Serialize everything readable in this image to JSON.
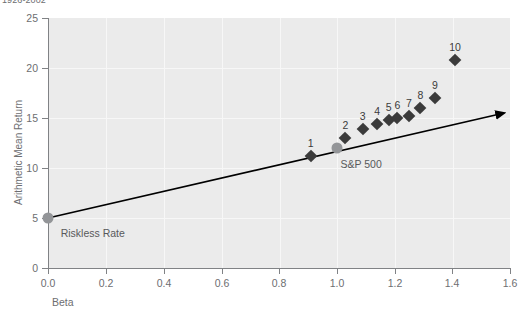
{
  "chart_data": {
    "type": "scatter",
    "title": "1926-2002",
    "xlabel": "Beta",
    "ylabel": "Arithmetic Mean Return",
    "xlim": [
      0.0,
      1.6
    ],
    "ylim": [
      0,
      25
    ],
    "xticks": [
      "0.0",
      "0.2",
      "0.4",
      "0.6",
      "0.8",
      "1.0",
      "1.2",
      "1.4",
      "1.6"
    ],
    "xtick_values": [
      0.0,
      0.2,
      0.4,
      0.6,
      0.8,
      1.0,
      1.2,
      1.4,
      1.6
    ],
    "yticks": [
      "0",
      "5",
      "10",
      "15",
      "20",
      "25"
    ],
    "ytick_values": [
      0,
      5,
      10,
      15,
      20,
      25
    ],
    "grid": true,
    "legend": "none",
    "series": [
      {
        "name": "Beta-sorted portfolios",
        "marker": "diamond",
        "color": "#3b3b3b",
        "points": [
          {
            "label": "1",
            "x": 0.91,
            "y": 11.2
          },
          {
            "label": "2",
            "x": 1.03,
            "y": 13.0
          },
          {
            "label": "3",
            "x": 1.09,
            "y": 13.9
          },
          {
            "label": "4",
            "x": 1.14,
            "y": 14.4
          },
          {
            "label": "5",
            "x": 1.18,
            "y": 14.8
          },
          {
            "label": "6",
            "x": 1.21,
            "y": 15.0
          },
          {
            "label": "7",
            "x": 1.25,
            "y": 15.2
          },
          {
            "label": "8",
            "x": 1.29,
            "y": 16.0
          },
          {
            "label": "9",
            "x": 1.34,
            "y": 17.0
          },
          {
            "label": "10",
            "x": 1.41,
            "y": 20.8
          }
        ]
      },
      {
        "name": "Benchmarks",
        "marker": "circle",
        "color": "#939598",
        "points": [
          {
            "label": "Riskless Rate",
            "x": 0.0,
            "y": 5.0
          },
          {
            "label": "S&P 500",
            "x": 1.0,
            "y": 12.0
          }
        ]
      }
    ],
    "sml_line": {
      "name": "Security Market Line",
      "from": {
        "x": 0.0,
        "y": 5.0
      },
      "to": {
        "x": 1.58,
        "y": 15.5
      },
      "arrow": true,
      "color": "#000000"
    },
    "annotations": [
      {
        "text": "Riskless Rate",
        "x": 0.03,
        "y": 3.5
      },
      {
        "text": "S&P 500",
        "x": 1.02,
        "y": 10.4
      }
    ]
  }
}
